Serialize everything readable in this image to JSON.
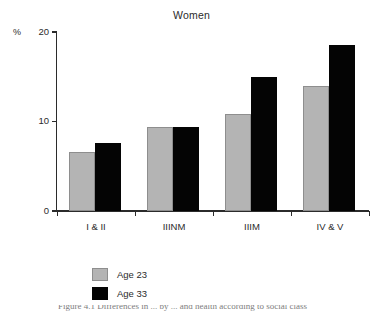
{
  "chart_data": {
    "type": "bar",
    "title": "Women",
    "xlabel": "",
    "ylabel": "%",
    "ylim": [
      0,
      20
    ],
    "yticks": [
      0,
      10,
      20
    ],
    "ytick_labels": [
      "0",
      "10",
      "20"
    ],
    "grid": false,
    "legend_position": "bottom-left",
    "categories": [
      "I & II",
      "IIINM",
      "IIIM",
      "IV & V"
    ],
    "series": [
      {
        "name": "Age 23",
        "color": "#b4b4b4",
        "values": [
          6.6,
          9.4,
          10.8,
          14.0
        ]
      },
      {
        "name": "Age 33",
        "color": "#040404",
        "values": [
          7.6,
          9.4,
          15.0,
          18.6
        ]
      }
    ]
  },
  "legend": {
    "items": [
      {
        "label": "Age 23",
        "swatch": "light"
      },
      {
        "label": "Age 33",
        "swatch": "dark"
      }
    ]
  },
  "caption": {
    "partial_text": "Figure 4.1  Differences in ... by ... and health according to social class"
  }
}
